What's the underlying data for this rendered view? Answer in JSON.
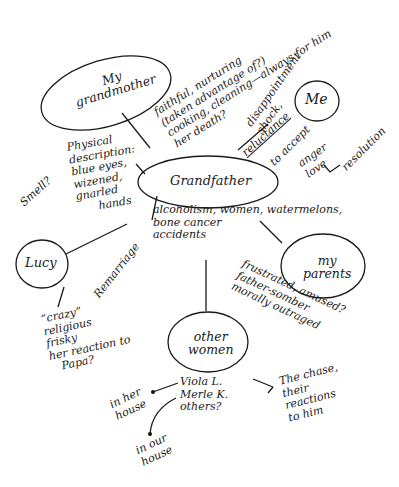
{
  "diagram": {
    "type": "cluster-map",
    "center": {
      "label": "Grandfather"
    },
    "nodes": [
      {
        "id": "grandmother",
        "label": "My\ngrandmother"
      },
      {
        "id": "me",
        "label": "Me"
      },
      {
        "id": "grandfather",
        "label": "Grandfather"
      },
      {
        "id": "lucy",
        "label": "Lucy"
      },
      {
        "id": "parents",
        "label": "my\nparents"
      },
      {
        "id": "other_women",
        "label": "other\nwomen"
      }
    ],
    "notes": {
      "grandmother_traits": "faithful, nurturing\n(taken advantage of?)\ncooking, cleaning—always for him\nher death?",
      "me_feelings": "disappointment\nshock,",
      "me_reluctance": "reluctance",
      "me_accept": "to accept",
      "me_anger_love": "anger\nlove",
      "me_resolution": "resolution",
      "physical": "Physical\ndescription:\nblue eyes,\nwizened,\ngnarled\n      hands",
      "smell": "Smell?",
      "grandfather_traits": "alcoholism, women, watermelons,\nbone cancer\naccidents",
      "remarriage": "Remarriage",
      "lucy_traits": "“crazy”\nreligious\nfrisky\nher reaction to\n   Papa?",
      "parents_traits": "frustrated, amused?\nfather-somber\nmorally outraged",
      "women_names": "Viola L.\nMerle K.\nothers?",
      "chase": "The chase,\ntheir\nreactions\nto him",
      "in_her_house": "in her\nhouse",
      "in_our_house": "in our\nhouse"
    },
    "colors": {
      "ink": "#1a1a1a",
      "background": "#ffffff"
    }
  }
}
